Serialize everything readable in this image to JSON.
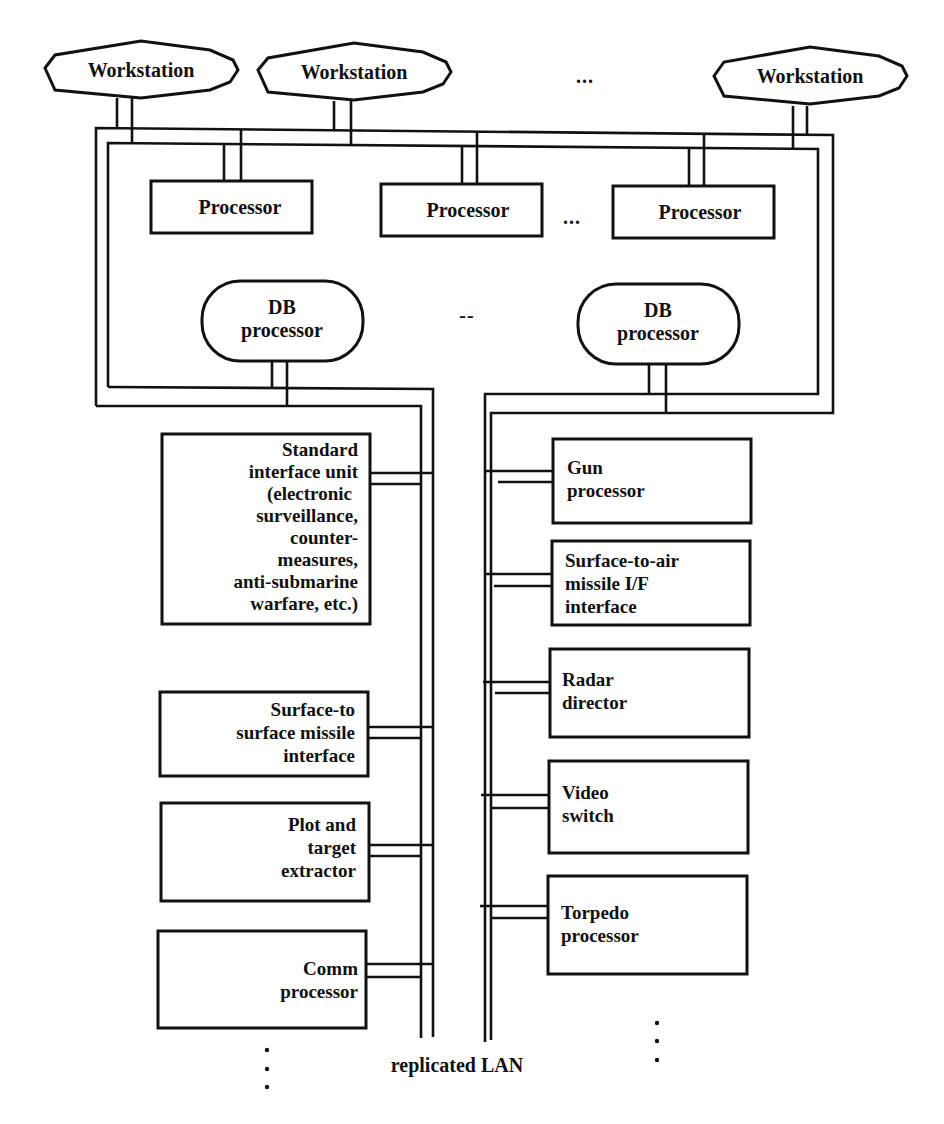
{
  "workstations": [
    {
      "label": "Workstation"
    },
    {
      "label": "Workstation"
    },
    {
      "label": "Workstation"
    }
  ],
  "workstation_ellipsis": "...",
  "processors": [
    {
      "label": "Processor"
    },
    {
      "label": "Processor"
    },
    {
      "label": "Processor"
    }
  ],
  "processor_ellipsis": "...",
  "db_processors": [
    {
      "line1": "DB",
      "line2": "processor"
    },
    {
      "line1": "DB",
      "line2": "processor"
    }
  ],
  "db_ellipsis": "--",
  "left_units": [
    {
      "lines": [
        "Standard",
        "interface unit",
        "(electronic",
        "surveillance,",
        "counter-",
        "measures,",
        "anti-submarine",
        "warfare, etc.)"
      ]
    },
    {
      "lines": [
        "Surface-to",
        "surface missile",
        "interface"
      ]
    },
    {
      "lines": [
        "Plot and",
        "target",
        "extractor"
      ]
    },
    {
      "lines": [
        "Comm",
        "processor"
      ]
    }
  ],
  "right_units": [
    {
      "lines": [
        "Gun",
        "processor"
      ]
    },
    {
      "lines": [
        "Surface-to-air",
        "missile I/F",
        "interface"
      ]
    },
    {
      "lines": [
        "Radar",
        "director"
      ]
    },
    {
      "lines": [
        "Video",
        "switch"
      ]
    },
    {
      "lines": [
        "Torpedo",
        "processor"
      ]
    }
  ],
  "lan_label": "replicated LAN"
}
